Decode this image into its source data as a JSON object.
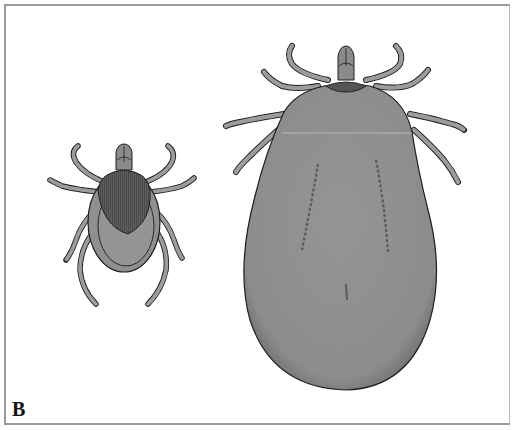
{
  "figure": {
    "panel_label": "B",
    "subjects": [
      {
        "id": "unfed-tick",
        "description": "Adult tick, unengorged, dorsal view",
        "legs": 8
      },
      {
        "id": "engorged-tick",
        "description": "Adult female tick, fully engorged, dorsal view",
        "legs": 8
      }
    ],
    "colors": {
      "background": "#ffffff",
      "frame": "#9a9a9a",
      "body_fill": "#8f8f8f",
      "scutum_fill": "#5e5e5e",
      "leg_fill": "#9c9c9c",
      "outline": "#1e1e1e"
    }
  }
}
